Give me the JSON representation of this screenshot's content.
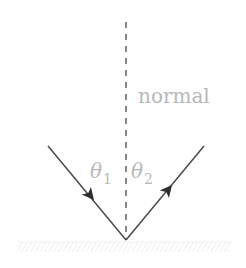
{
  "diagram": {
    "type": "reflection",
    "normal_label": "normal",
    "incident_angle": {
      "symbol": "θ",
      "subscript": "1"
    },
    "reflected_angle": {
      "symbol": "θ",
      "subscript": "2"
    },
    "colors": {
      "ray": "#4a4a4a",
      "normal_line": "#555555",
      "label": "#b8b8b8",
      "surface": "#eeeeee"
    }
  }
}
